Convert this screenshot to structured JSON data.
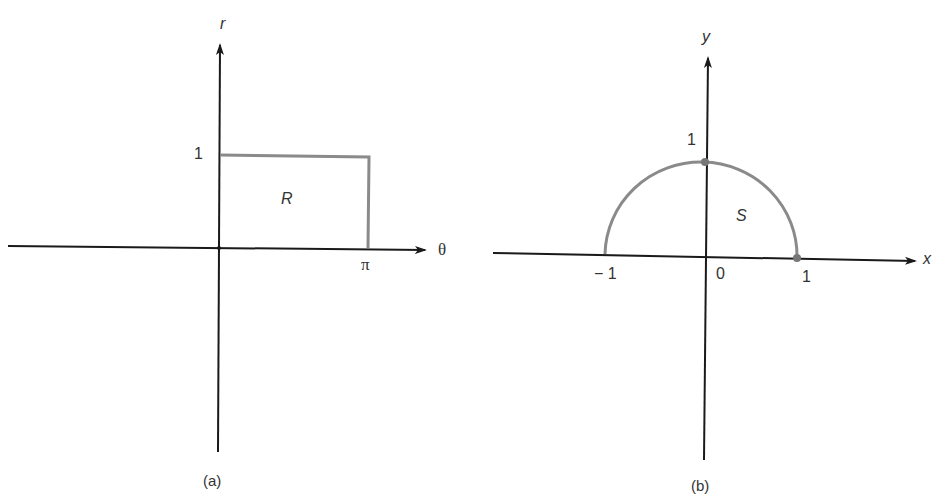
{
  "panels": [
    {
      "id": "a",
      "caption": "(a)",
      "x_axis_label": "θ",
      "y_axis_label": "r",
      "tick_x": "π",
      "tick_y": "1",
      "region_label": "R",
      "region_shape": "rectangle [0, π] × [0, 1]"
    },
    {
      "id": "b",
      "caption": "(b)",
      "x_axis_label": "x",
      "y_axis_label": "y",
      "tick_x_neg": "− 1",
      "tick_origin": "0",
      "tick_x_pos": "1",
      "tick_y": "1",
      "region_label": "S",
      "region_shape": "upper half unit disk"
    }
  ],
  "colors": {
    "axis": "#1a1a1a",
    "region_outline": "#8a8a8a",
    "text": "#333333"
  }
}
